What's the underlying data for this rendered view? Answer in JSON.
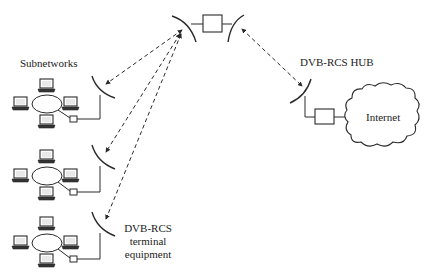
{
  "diagram": {
    "type": "network-topology",
    "title": "",
    "labels": {
      "subnetworks": "Subnetworks",
      "hub": "DVB-RCS HUB",
      "internet": "Internet",
      "terminal_line1": "DVB-RCS",
      "terminal_line2": "terminal",
      "terminal_line3": "equipment"
    },
    "nodes": [
      {
        "id": "satellite",
        "kind": "satellite-transponder"
      },
      {
        "id": "terminal-1",
        "kind": "dish-antenna",
        "subnetwork": 1
      },
      {
        "id": "terminal-2",
        "kind": "dish-antenna",
        "subnetwork": 2
      },
      {
        "id": "terminal-3",
        "kind": "dish-antenna",
        "subnetwork": 3
      },
      {
        "id": "hub",
        "kind": "dish-antenna",
        "label": "DVB-RCS HUB"
      },
      {
        "id": "hub-router",
        "kind": "box"
      },
      {
        "id": "internet",
        "kind": "cloud",
        "label": "Internet"
      }
    ],
    "subnetworks": [
      {
        "id": 1,
        "laptops": 4,
        "topology": "ring"
      },
      {
        "id": 2,
        "laptops": 4,
        "topology": "ring"
      },
      {
        "id": 3,
        "laptops": 4,
        "topology": "ring"
      }
    ],
    "links": [
      {
        "from": "satellite",
        "to": "terminal-1",
        "style": "dashed",
        "arrows": "both"
      },
      {
        "from": "satellite",
        "to": "terminal-2",
        "style": "dashed",
        "arrows": "both"
      },
      {
        "from": "satellite",
        "to": "terminal-3",
        "style": "dashed",
        "arrows": "both"
      },
      {
        "from": "satellite",
        "to": "hub",
        "style": "dashed",
        "arrows": "both"
      },
      {
        "from": "hub",
        "to": "hub-router",
        "style": "solid"
      },
      {
        "from": "hub-router",
        "to": "internet",
        "style": "solid"
      }
    ],
    "colors": {
      "stroke": "#2a2a2a",
      "background": "#ffffff",
      "laptop_screen": "#e8e8e8",
      "laptop_base": "#333333"
    }
  }
}
